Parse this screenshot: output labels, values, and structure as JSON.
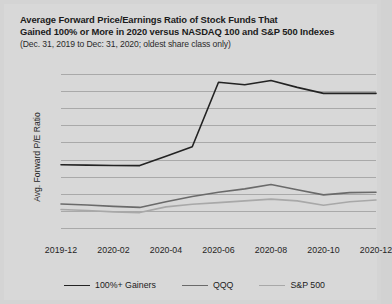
{
  "chart_data": {
    "type": "line",
    "title": "Average Forward Price/Earnings Ratio of Stock Funds That Gained 100% or More in 2020 versus NASDAQ 100 and S&P 500 Indexes",
    "title_line1": "Average Forward Price/Earnings Ratio of Stock Funds That",
    "title_line2": "Gained 100% or More in 2020 versus NASDAQ 100 and S&P 500 Indexes",
    "subtitle": "(Dec. 31, 2019 to Dec: 31, 2020; oldest share class only)",
    "xlabel": "",
    "ylabel": "Avg. Forward P/E Ratio",
    "ylim": [
      5,
      105
    ],
    "yticks": [
      "100.0",
      "90.0",
      "80.0",
      "70.0",
      "60.0",
      "50.0",
      "40.0",
      "30.0",
      "20.0",
      "10.0"
    ],
    "ytick_values": [
      100,
      90,
      80,
      70,
      60,
      50,
      40,
      30,
      20,
      10
    ],
    "grid": true,
    "legend_position": "bottom",
    "x": [
      "2019-12",
      "2020-01",
      "2020-02",
      "2020-03",
      "2020-04",
      "2020-05",
      "2020-06",
      "2020-07",
      "2020-08",
      "2020-09",
      "2020-10",
      "2020-11",
      "2020-12"
    ],
    "xticks": [
      "2019-12",
      "2020-02",
      "2020-04",
      "2020-06",
      "2020-08",
      "2020-10",
      "2020-12"
    ],
    "xtick_indices": [
      0,
      2,
      4,
      6,
      8,
      10,
      12
    ],
    "series": [
      {
        "name": "100%+ Gainers",
        "color": "#232323",
        "values": [
          47.0,
          46.8,
          46.6,
          46.5,
          52.0,
          57.5,
          95.0,
          93.5,
          96.0,
          92.0,
          88.5,
          88.5,
          88.5
        ]
      },
      {
        "name": "QQQ",
        "color": "#6a6a6a",
        "values": [
          24.2,
          23.6,
          22.8,
          22.2,
          25.5,
          28.5,
          31.0,
          33.0,
          35.5,
          32.5,
          29.5,
          30.8,
          31.0
        ]
      },
      {
        "name": "S&P 500",
        "color": "#a8a8a8",
        "values": [
          21.0,
          20.4,
          19.6,
          19.2,
          22.5,
          24.0,
          25.0,
          26.0,
          27.0,
          26.0,
          23.5,
          25.5,
          26.5
        ]
      }
    ]
  },
  "legend": {
    "items": [
      {
        "label": "100%+ Gainers",
        "color": "#232323"
      },
      {
        "label": "QQQ",
        "color": "#6a6a6a"
      },
      {
        "label": "S&P 500",
        "color": "#a8a8a8"
      }
    ]
  }
}
